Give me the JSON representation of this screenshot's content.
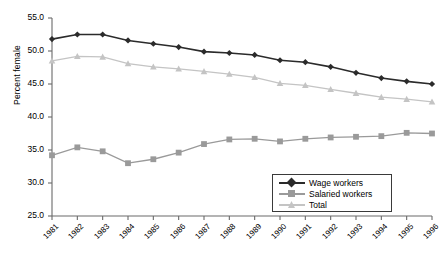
{
  "chart_data": {
    "type": "line",
    "title": "",
    "xlabel": "",
    "ylabel": "Percent female",
    "ylim": [
      25.0,
      55.0
    ],
    "yticks": [
      "25.0",
      "30.0",
      "35.0",
      "40.0",
      "45.0",
      "50.0",
      "55.0"
    ],
    "ytick_values": [
      25.0,
      30.0,
      35.0,
      40.0,
      45.0,
      50.0,
      55.0
    ],
    "grid": false,
    "legend_position": "bottom-right",
    "categories": [
      "1981",
      "1982",
      "1983",
      "1984",
      "1985",
      "1986",
      "1987",
      "1988",
      "1989",
      "1990",
      "1991",
      "1992",
      "1993",
      "1994",
      "1995",
      "1996"
    ],
    "x": [
      1981,
      1982,
      1983,
      1984,
      1985,
      1986,
      1987,
      1988,
      1989,
      1990,
      1991,
      1992,
      1993,
      1994,
      1995,
      1996
    ],
    "series": [
      {
        "name": "Wage workers",
        "marker": "diamond",
        "color": "#2b2b2b",
        "values": [
          51.8,
          52.5,
          52.5,
          51.6,
          51.1,
          50.6,
          49.9,
          49.7,
          49.4,
          48.6,
          48.3,
          47.6,
          46.7,
          45.9,
          45.4,
          45.0
        ]
      },
      {
        "name": "Salaried workers",
        "marker": "square",
        "color": "#9a9a9a",
        "values": [
          34.2,
          35.4,
          34.8,
          33.0,
          33.6,
          34.6,
          35.9,
          36.6,
          36.7,
          36.3,
          36.7,
          36.9,
          37.0,
          37.1,
          37.6,
          37.5
        ]
      },
      {
        "name": "Total",
        "marker": "triangle",
        "color": "#c4c4c4",
        "values": [
          48.5,
          49.2,
          49.1,
          48.1,
          47.6,
          47.3,
          46.9,
          46.5,
          46.0,
          45.1,
          44.8,
          44.2,
          43.6,
          43.0,
          42.7,
          42.3
        ]
      }
    ]
  },
  "axes": {
    "axis_color": "#6a6a6a",
    "tick_label_color": "#000000"
  }
}
